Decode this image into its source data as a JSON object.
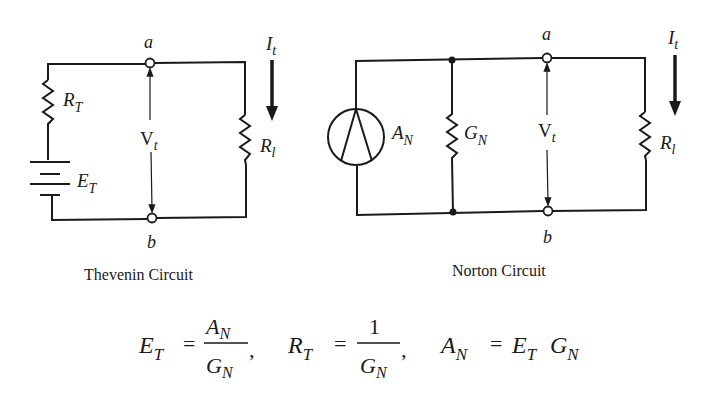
{
  "thevenin": {
    "caption": "Thevenin Circuit",
    "node_a": "a",
    "node_b": "b",
    "resistor_label": "R",
    "resistor_sub": "T",
    "source_label": "E",
    "source_sub": "T",
    "voltage_label": "V",
    "voltage_sub": "t",
    "load_label": "R",
    "load_sub": "l",
    "current_label": "I",
    "current_sub": "t"
  },
  "norton": {
    "caption": "Norton Circuit",
    "node_a": "a",
    "node_b": "b",
    "source_label": "A",
    "source_sub": "N",
    "conductance_label": "G",
    "conductance_sub": "N",
    "voltage_label": "V",
    "voltage_sub": "t",
    "load_label": "R",
    "load_sub": "l",
    "current_label": "I",
    "current_sub": "t"
  },
  "equations": {
    "eq1": {
      "lhs": "E",
      "lhs_sub": "T",
      "eq": "=",
      "num": "A",
      "num_sub": "N",
      "den": "G",
      "den_sub": "N",
      "sep": ","
    },
    "eq2": {
      "lhs": "R",
      "lhs_sub": "T",
      "eq": "=",
      "num": "1",
      "den": "G",
      "den_sub": "N",
      "sep": ","
    },
    "eq3": {
      "lhs": "A",
      "lhs_sub": "N",
      "eq": "=",
      "r1": "E",
      "r1_sub": "T",
      "r2": "G",
      "r2_sub": "N"
    }
  }
}
